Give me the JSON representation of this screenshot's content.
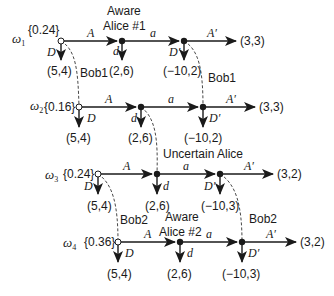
{
  "diagram": {
    "type": "extensive-form game tree with information sets",
    "rows": [
      {
        "state": "ω1",
        "state_base": "ω",
        "state_sub": "1",
        "prob": "{0.24}",
        "move1": "A",
        "move1_down": "D",
        "payoff_down1": "(5,4)",
        "alice_label_line1": "Aware",
        "alice_label_line2": "Alice #1",
        "move2": "a",
        "move2_down": "d",
        "payoff_down2": "(2,6)",
        "move3": "A′",
        "move3_down": "D′",
        "payoff_down3": "(−10,2)",
        "payoff_end": "(3,3)"
      },
      {
        "state": "ω2",
        "state_base": "ω",
        "state_sub": "2",
        "prob": "{0.16}",
        "move1": "A",
        "move1_down": "D",
        "payoff_down1": "(5,4)",
        "move2": "a",
        "move2_down": "d",
        "payoff_down2": "(2,6)",
        "move3": "A′",
        "move3_down": "D′",
        "payoff_down3": "(−10,2)",
        "payoff_end": "(3,3)"
      },
      {
        "state": "ω3",
        "state_base": "ω",
        "state_sub": "3",
        "prob": "{0.24}",
        "move1": "A",
        "move1_down": "D",
        "payoff_down1": "(5,4)",
        "move2": "a",
        "move2_down": "d",
        "payoff_down2": "(2,6)",
        "move3": "A′",
        "move3_down": "D′",
        "payoff_down3": "(−10,3)",
        "payoff_end": "(3,2)"
      },
      {
        "state": "ω4",
        "state_base": "ω",
        "state_sub": "4",
        "prob": "{0.36}",
        "move1": "A",
        "move1_down": "D",
        "payoff_down1": "(5,4)",
        "alice_label_line1": "Aware",
        "alice_label_line2": "Alice #2",
        "move2": "a",
        "move2_down": "d",
        "payoff_down2": "(2,6)",
        "move3": "A′",
        "move3_down": "D′",
        "payoff_down3": "(−10,3)",
        "payoff_end": "(3,2)"
      }
    ],
    "info_sets": {
      "bob1_left": "Bob1",
      "bob1_right": "Bob1",
      "uncertain_alice": "Uncertain Alice",
      "bob2_left": "Bob2",
      "bob2_right": "Bob2"
    },
    "colors": {
      "ink": "#1a1a1a",
      "background": "#ffffff"
    }
  }
}
